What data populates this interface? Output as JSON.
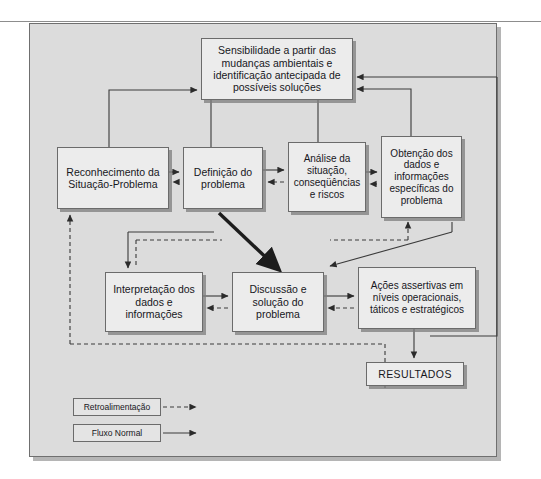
{
  "diagram": {
    "title_visible": false,
    "nodes": {
      "sensibilidade": "Sensibilidade a partir das mudanças ambientais e identificação antecipada de possíveis soluções",
      "reconhecimento": "Reconhecimento da Situação-Problema",
      "definicao": "Definição do problema",
      "analise": "Análise da situação, conseqüências e riscos",
      "obtencao": "Obtenção dos dados e informações específicas do problema",
      "interpretacao": "Interpretação dos dados e informações",
      "discussao": "Discussão e solução do problema",
      "acoes": "Ações assertivas em níveis operacionais, táticos e estratégicos",
      "resultados": "RESULTADOS"
    },
    "legend": {
      "feedback_label": "Retroalimentação",
      "normal_label": "Fluxo Normal"
    },
    "colors": {
      "panel_background": "#dcdcdc",
      "node_fill": "#ececec",
      "node_border": "#6b6b6b",
      "line": "#3a3a3a",
      "text": "#17171c"
    }
  }
}
